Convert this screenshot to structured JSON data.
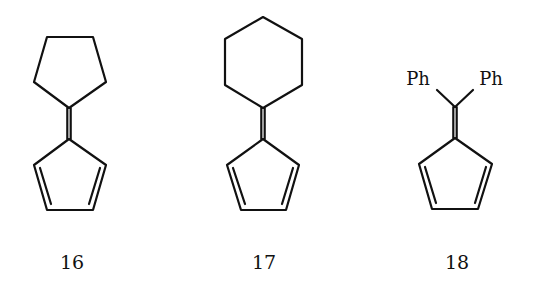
{
  "figure": {
    "type": "chemical-structures",
    "stroke_color": "#111111",
    "background": "#ffffff"
  },
  "compounds": [
    {
      "number": "16",
      "name": "cyclopentylidene-cyclopentadiene (fulvene)",
      "top_group": "cyclopentane",
      "bottom_ring": "cyclopentadiene",
      "label_pos": [
        72,
        262
      ]
    },
    {
      "number": "17",
      "name": "cyclohexylidene-cyclopentadiene (fulvene)",
      "top_group": "cyclohexane",
      "bottom_ring": "cyclopentadiene",
      "label_pos": [
        264,
        262
      ]
    },
    {
      "number": "18",
      "name": "6,6-diphenylfulvene",
      "top_group": "diphenylmethylidene",
      "substituents": [
        "Ph",
        "Ph"
      ],
      "bottom_ring": "cyclopentadiene",
      "label_pos": [
        457,
        262
      ]
    }
  ]
}
